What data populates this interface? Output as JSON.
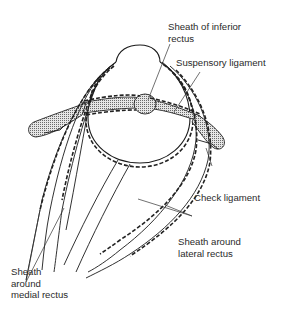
{
  "figure": {
    "labels": {
      "sheath_inferior_rectus": "Sheath of inferior\nrectus",
      "suspensory_ligament": "Suspensory ligament",
      "check_ligament": "Check ligament",
      "sheath_lateral_rectus": "Sheath around\nlateral rectus",
      "sheath_medial_rectus": "Sheath\naround\nmedial rectus"
    },
    "colors": {
      "line": "#1a1a1a",
      "stipple": "#9a9a9a",
      "background": "#ffffff",
      "text": "#2a2a2a"
    }
  }
}
